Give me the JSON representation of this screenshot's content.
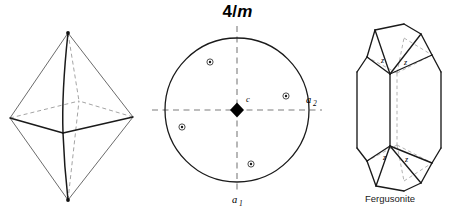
{
  "figure": {
    "point_group": {
      "symbol_number": "4",
      "symbol_slash": "/",
      "symbol_mirror": "m",
      "full": "4/m"
    },
    "mineral_caption": "Fergusonite"
  },
  "stereogram": {
    "center_symbol_name": "four-fold-axis-diamond",
    "center_label": "c",
    "axis_labels": {
      "a1_base": "a",
      "a1_sub": "1",
      "a2_base": "a",
      "a2_sub": "2"
    },
    "circle": {
      "cx": 237,
      "cy": 110,
      "r": 72,
      "stroke": "#1a1a1a"
    },
    "axes": [
      {
        "name": "a2-axis-horizontal",
        "x1": 152,
        "y1": 110,
        "x2": 322,
        "y2": 110
      },
      {
        "name": "a1-axis-vertical",
        "x1": 237,
        "y1": 26,
        "x2": 237,
        "y2": 194
      }
    ],
    "poles": [
      {
        "name": "pole-upper-left",
        "cx": 210,
        "cy": 62,
        "type": "circle-with-dot"
      },
      {
        "name": "pole-right",
        "cx": 286,
        "cy": 96,
        "type": "circle-with-dot"
      },
      {
        "name": "pole-left",
        "cx": 182,
        "cy": 127,
        "type": "circle-with-dot"
      },
      {
        "name": "pole-lower",
        "cx": 251,
        "cy": 164,
        "type": "circle-with-dot"
      }
    ]
  },
  "bipyramid": {
    "name": "tetragonal-bipyramid",
    "vertices": {
      "top": {
        "x": 68,
        "y": 33
      },
      "bottom": {
        "x": 68,
        "y": 200
      },
      "left": {
        "x": 10,
        "y": 118
      },
      "right": {
        "x": 133,
        "y": 117
      },
      "front": {
        "x": 63,
        "y": 133
      },
      "back": {
        "x": 79,
        "y": 101
      }
    },
    "stroke": "#2a2a2a"
  },
  "crystal": {
    "name": "fergusonite-crystal",
    "face_labels": [
      {
        "name": "face-label-z-upper-left",
        "text": "z",
        "x": 381,
        "y": 63
      },
      {
        "name": "face-label-z-upper-right",
        "text": "z",
        "x": 404,
        "y": 65
      },
      {
        "name": "face-label-z-lower-left",
        "text": "z",
        "x": 383,
        "y": 160
      },
      {
        "name": "face-label-z-lower-right",
        "text": "z",
        "x": 405,
        "y": 162
      }
    ],
    "stroke": "#1a1a1a"
  },
  "colors": {
    "ink": "#000000",
    "line": "#1a1a1a",
    "thin_line": "#4a4a4a",
    "dashed": "#8a8a8a",
    "background": "#ffffff"
  }
}
